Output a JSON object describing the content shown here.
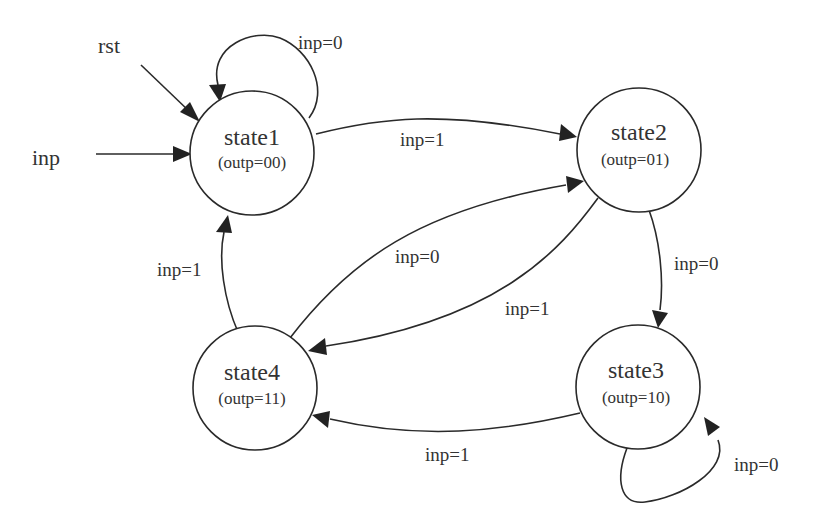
{
  "diagram": {
    "type": "finite-state-machine",
    "inputs": {
      "rst": "rst",
      "inp": "inp"
    },
    "states": [
      {
        "id": "state1",
        "name": "state1",
        "output": "(outp=00)"
      },
      {
        "id": "state2",
        "name": "state2",
        "output": "(outp=01)"
      },
      {
        "id": "state3",
        "name": "state3",
        "output": "(outp=10)"
      },
      {
        "id": "state4",
        "name": "state4",
        "output": "(outp=11)"
      }
    ],
    "transitions": [
      {
        "from": "state1",
        "to": "state1",
        "label": "inp=0"
      },
      {
        "from": "state1",
        "to": "state2",
        "label": "inp=1"
      },
      {
        "from": "state2",
        "to": "state3",
        "label": "inp=0"
      },
      {
        "from": "state2",
        "to": "state4",
        "label": "inp=1"
      },
      {
        "from": "state3",
        "to": "state3",
        "label": "inp=0"
      },
      {
        "from": "state3",
        "to": "state4",
        "label": "inp=1"
      },
      {
        "from": "state4",
        "to": "state2",
        "label": "inp=0"
      },
      {
        "from": "state4",
        "to": "state1",
        "label": "inp=1"
      }
    ],
    "colors": {
      "stroke": "#2a2a2a",
      "text": "#333333",
      "background": "#ffffff"
    }
  }
}
